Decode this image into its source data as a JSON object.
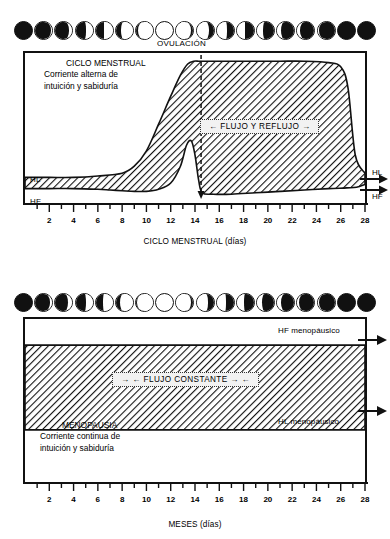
{
  "chart_data": [
    {
      "type": "area",
      "id": "ciclo-menstrual",
      "title": "CICLO MENSTRUAL",
      "subtitle_line1": "Corriente alterna de",
      "subtitle_line2": "intuición y sabiduría",
      "xlabel": "CICLO MENSTRUAL (días)",
      "xlim": [
        0,
        28
      ],
      "ticks": [
        2,
        4,
        6,
        8,
        10,
        12,
        14,
        16,
        18,
        20,
        22,
        24,
        26,
        28
      ],
      "annotations": [
        {
          "name": "ovulacion",
          "text": "OVULACIÓN",
          "x": 14.5
        },
        {
          "name": "flujo-y-reflujo",
          "text": "←  FLUJO Y REFLUJO  →",
          "x": 21
        }
      ],
      "axis_labels_left": [
        {
          "name": "hl-left",
          "text": "HL"
        },
        {
          "name": "hf-left",
          "text": "HF"
        }
      ],
      "axis_labels_right": [
        {
          "name": "hl-right",
          "text": "HL"
        },
        {
          "name": "hf-right",
          "text": "HF"
        }
      ],
      "series": [
        {
          "name": "HL (límite superior / corriente alterna)",
          "x": [
            0,
            2,
            4,
            6,
            8,
            9,
            10,
            11,
            12,
            12.8,
            13.4,
            13.9,
            14.3,
            14.6,
            15.5,
            17,
            19,
            21,
            23,
            25,
            26,
            26.6,
            27.2,
            28
          ],
          "values": [
            0.14,
            0.14,
            0.14,
            0.15,
            0.17,
            0.22,
            0.33,
            0.52,
            0.72,
            0.87,
            0.95,
            0.97,
            0.97,
            0.97,
            0.97,
            0.97,
            0.97,
            0.97,
            0.97,
            0.96,
            0.93,
            0.78,
            0.3,
            0.17
          ]
        },
        {
          "name": "HF (límite inferior / corriente alterna)",
          "x": [
            0,
            2,
            4,
            6,
            7,
            8,
            9,
            10,
            11,
            12,
            12.8,
            13.3,
            13.7,
            14.0,
            14.3,
            14.6,
            15.5,
            17,
            19,
            21,
            23,
            25,
            26.5,
            27.3,
            28
          ],
          "values": [
            0.06,
            0.06,
            0.06,
            0.055,
            0.05,
            0.045,
            0.04,
            0.04,
            0.055,
            0.1,
            0.22,
            0.37,
            0.4,
            0.3,
            0.12,
            0.03,
            0.02,
            0.02,
            0.03,
            0.04,
            0.05,
            0.06,
            0.065,
            0.07,
            0.09
          ]
        }
      ]
    },
    {
      "type": "area",
      "id": "menopausia",
      "title": "MENOPAUSIA",
      "subtitle_line1": "Corriente continua de",
      "subtitle_line2": "intuición y sabiduría",
      "xlabel": "MESES (días)",
      "xlim": [
        0,
        28
      ],
      "ticks": [
        2,
        4,
        6,
        8,
        10,
        12,
        14,
        16,
        18,
        20,
        22,
        24,
        26,
        28
      ],
      "annotations": [
        {
          "name": "flujo-constante",
          "text": "→ ←  FLUJO CONSTANTE  → ←",
          "x": 14
        }
      ],
      "axis_labels_right": [
        {
          "name": "hf-menopausico",
          "text": "HF menopáusico"
        },
        {
          "name": "hl-menopausico",
          "text": "HL menopáusico"
        }
      ],
      "series": [
        {
          "name": "HF menopáusico (banda superior)",
          "x": [
            0,
            28
          ],
          "values": [
            0.84,
            0.84
          ]
        },
        {
          "name": "HL menopáusico (banda inferior)",
          "x": [
            0,
            28
          ],
          "values": [
            0.32,
            0.32
          ]
        }
      ]
    }
  ],
  "moon_rows": [
    {
      "name": "moon-phases-menstrual",
      "count": 18,
      "phases": [
        0.0,
        0.04,
        0.1,
        0.18,
        0.27,
        0.36,
        0.44,
        0.5,
        0.56,
        0.63,
        0.7,
        0.77,
        0.83,
        0.88,
        0.93,
        0.96,
        0.99,
        1.0
      ]
    },
    {
      "name": "moon-phases-menopause",
      "count": 18,
      "phases": [
        0.0,
        0.05,
        0.12,
        0.2,
        0.29,
        0.38,
        0.46,
        0.52,
        0.58,
        0.65,
        0.72,
        0.79,
        0.85,
        0.9,
        0.94,
        0.97,
        0.99,
        1.0
      ]
    }
  ],
  "colors": {
    "ink": "#111111",
    "paper": "#ffffff",
    "hatch": "#111111",
    "tag_bg": "#f2f2f2"
  }
}
